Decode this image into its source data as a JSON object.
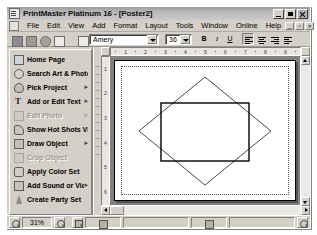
{
  "window": {
    "title": "PrintMaster Platinum 16 - [Poster2]",
    "app_icon": "document-window-icon",
    "minimize_label": "Minimize",
    "maximize_label": "Maximize",
    "close_label": "Close"
  },
  "menu": {
    "mdi_icon": "mdi-document-icon",
    "items": [
      {
        "label": "File"
      },
      {
        "label": "Edit"
      },
      {
        "label": "View"
      },
      {
        "label": "Add"
      },
      {
        "label": "Format"
      },
      {
        "label": "Layout"
      },
      {
        "label": "Tools"
      },
      {
        "label": "Window"
      },
      {
        "label": "Online"
      },
      {
        "label": "Help"
      }
    ],
    "mdi_buttons": [
      {
        "name": "mdi-minimize-button",
        "glyph": "_"
      },
      {
        "name": "mdi-restore-button",
        "glyph": "▫"
      },
      {
        "name": "mdi-close-button",
        "glyph": "×"
      }
    ]
  },
  "toolbar": {
    "buttons": [
      {
        "name": "save-button",
        "icon": "save-icon",
        "label": "Save"
      },
      {
        "name": "print-button",
        "icon": "print-icon",
        "label": "Print"
      },
      {
        "name": "print-preview-button",
        "icon": "print-preview-icon",
        "label": "Print Preview"
      },
      {
        "name": "new-page-button",
        "icon": "new-page-icon",
        "label": "New Page"
      },
      {
        "name": "page-setup-button",
        "icon": "page-setup-icon",
        "label": "Page Setup"
      }
    ],
    "font_name": "Amery",
    "font_name_placeholder": "Font",
    "font_size": "36",
    "font_size_placeholder": "Size",
    "bold_label": "B",
    "italic_label": "I",
    "underline_label": "U",
    "align_left_label": "Align Left",
    "align_center_label": "Align Center",
    "align_right_label": "Align Right",
    "align_justify_label": "Justify"
  },
  "sidebar": {
    "items": [
      {
        "label": "Home Page",
        "icon": "home",
        "disabled": false,
        "submenu": ""
      },
      {
        "label": "Search Art & Photos",
        "icon": "search",
        "disabled": false,
        "submenu": ""
      },
      {
        "label": "Pick Project",
        "icon": "proj",
        "disabled": false,
        "submenu": "▸"
      },
      {
        "label": "Add or Edit Text",
        "icon": "text",
        "disabled": false,
        "submenu": "▸"
      },
      {
        "label": "Edit Photo",
        "icon": "photo",
        "disabled": true,
        "submenu": "▸"
      },
      {
        "label": "Show Hot Shots Viewer",
        "icon": "hot",
        "disabled": false,
        "submenu": ""
      },
      {
        "label": "Draw Object",
        "icon": "draw",
        "disabled": false,
        "submenu": "▸"
      },
      {
        "label": "Crop Object",
        "icon": "crop",
        "disabled": true,
        "submenu": ""
      },
      {
        "label": "Apply Color Set",
        "icon": "color",
        "disabled": false,
        "submenu": ""
      },
      {
        "label": "Add Sound or Video",
        "icon": "sound",
        "disabled": false,
        "submenu": "▸"
      },
      {
        "label": "Create Party Set",
        "icon": "party",
        "disabled": false,
        "submenu": ""
      }
    ]
  },
  "rulers": {
    "horizontal_ticks": [
      "1",
      "2",
      "3",
      "4",
      "5",
      "6",
      "7",
      "8",
      "9"
    ],
    "vertical_ticks": [
      "1",
      "2",
      "3",
      "4",
      "5",
      "6"
    ],
    "units": "inches"
  },
  "canvas": {
    "page_name": "Poster2",
    "shapes": [
      {
        "name": "diamond-shape",
        "type": "rotated-square",
        "stroke": "#3a3a3a",
        "fill": "none"
      },
      {
        "name": "rectangle-shape",
        "type": "rectangle",
        "stroke": "#000000",
        "fill": "none"
      }
    ]
  },
  "status": {
    "zoom_out_label": "Zoom Out",
    "zoom_value": "31%",
    "zoom_in_label": "Zoom In",
    "fit_page_label": "Fit Page",
    "page_nav_label": "Page Navigator",
    "layers_label": "Layers",
    "help_label": "Help"
  },
  "colors": {
    "window_face": "#d4d0c8",
    "titlebar": "#b8b8b8",
    "canvas_backdrop": "#808080",
    "page": "#ffffff",
    "shape_stroke": "#000000"
  }
}
